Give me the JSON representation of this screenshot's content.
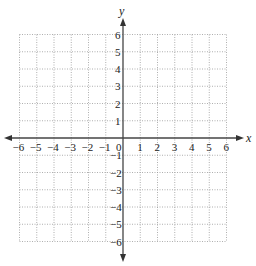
{
  "diagram": {
    "type": "coordinate-grid",
    "x_axis": {
      "label": "x",
      "min": -6,
      "max": 6,
      "step": 1,
      "tick_labels": [
        "-6",
        "-5",
        "-4",
        "-3",
        "-2",
        "-1",
        "1",
        "2",
        "3",
        "4",
        "5",
        "6"
      ]
    },
    "y_axis": {
      "label": "y",
      "min": -6,
      "max": 6,
      "step": 1,
      "tick_labels": [
        "6",
        "5",
        "4",
        "3",
        "2",
        "1",
        "-1",
        "-2",
        "-3",
        "-4",
        "-5",
        "-6"
      ]
    },
    "origin_label": "0",
    "grid": {
      "style": "dotted",
      "color": "#9a9a9a"
    },
    "axis_color": "#444444"
  }
}
